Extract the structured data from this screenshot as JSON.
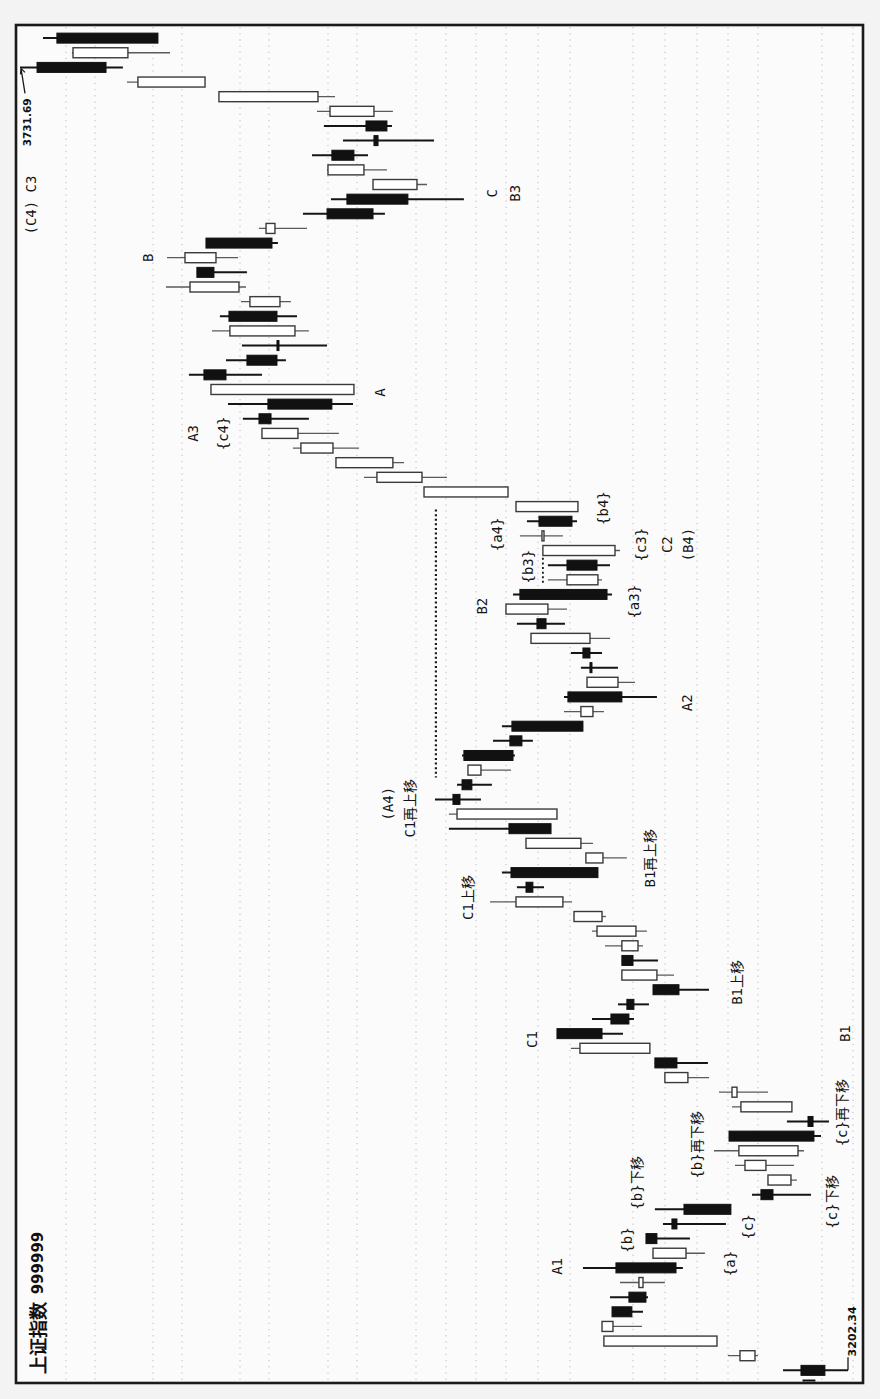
{
  "chart_data": {
    "type": "candlestick",
    "title": "上证指数 999999",
    "instrument": {
      "name": "上证指数",
      "code": "999999"
    },
    "orientation": "rotated 90° counter-clockwise: time runs bottom→top, price increases toward the left",
    "xlabel": "",
    "ylabel": "",
    "price_axis": {
      "max": 3731.69,
      "min": 3202.34
    },
    "grid": true,
    "legend": null,
    "colors": {
      "up_body": "#ffffff",
      "down_body": "#111111",
      "outline": "#333333",
      "frame": "#1a1a1a"
    },
    "markers": {
      "high": {
        "label": "3731.69",
        "index": 90,
        "price": 3731.69
      },
      "low": {
        "label": "3202.34",
        "index": 1,
        "price": 3202.34
      }
    },
    "candle_columns": [
      "open",
      "high",
      "low",
      "close"
    ],
    "candles": [
      [
        3231.1,
        3231.1,
        3223.5,
        3223.5
      ],
      [
        3232.4,
        3243.9,
        3202.34,
        3217.1
      ],
      [
        3261.8,
        3279.1,
        3259.9,
        3271.4
      ],
      [
        3286.1,
        3358.4,
        3286.1,
        3358.4
      ],
      [
        3352.6,
        3359.6,
        3334.1,
        3359.6
      ],
      [
        3353.2,
        3353.2,
        3333.4,
        3340.5
      ],
      [
        3342.4,
        3354.5,
        3330.2,
        3331.5
      ],
      [
        3333.4,
        3348.1,
        3319.4,
        3336.0
      ],
      [
        3350.7,
        3371.8,
        3307.9,
        3312.3
      ],
      [
        3305.9,
        3327.0,
        3293.8,
        3327.0
      ],
      [
        3331.5,
        3331.5,
        3303.4,
        3324.5
      ],
      [
        3314.9,
        3320.6,
        3280.4,
        3311.7
      ],
      [
        3307.2,
        3325.8,
        3277.2,
        3277.2
      ],
      [
        3258.0,
        3263.7,
        3226.0,
        3250.3
      ],
      [
        3238.8,
        3253.5,
        3235.0,
        3253.5
      ],
      [
        3254.8,
        3274.6,
        3236.9,
        3268.2
      ],
      [
        3234.3,
        3288.0,
        3230.5,
        3272.1
      ],
      [
        3278.4,
        3278.4,
        3219.6,
        3224.1
      ],
      [
        3227.9,
        3241.4,
        3214.5,
        3224.7
      ],
      [
        3238.2,
        3276.5,
        3238.2,
        3270.8
      ],
      [
        3273.3,
        3284.8,
        3253.5,
        3276.5
      ],
      [
        3304.7,
        3319.4,
        3291.2,
        3319.4
      ],
      [
        3325.8,
        3325.8,
        3291.9,
        3311.7
      ],
      [
        3329.0,
        3379.5,
        3329.0,
        3373.7
      ],
      [
        3388.4,
        3388.4,
        3346.2,
        3359.6
      ],
      [
        3353.9,
        3366.0,
        3339.2,
        3342.4
      ],
      [
        3343.7,
        3349.4,
        3329.6,
        3339.2
      ],
      [
        3327.0,
        3327.0,
        3291.2,
        3310.4
      ],
      [
        3324.5,
        3346.9,
        3313.6,
        3346.9
      ],
      [
        3346.9,
        3346.9,
        3323.8,
        3339.8
      ],
      [
        3336.6,
        3357.7,
        3333.4,
        3346.9
      ],
      [
        3337.9,
        3366.0,
        3330.9,
        3362.8
      ],
      [
        3359.6,
        3377.5,
        3357.1,
        3377.5
      ],
      [
        3384.6,
        3431.2,
        3378.8,
        3414.6
      ],
      [
        3408.2,
        3414.0,
        3396.7,
        3403.8
      ],
      [
        3417.8,
        3423.6,
        3362.2,
        3362.2
      ],
      [
        3359.0,
        3369.9,
        3343.7,
        3369.9
      ],
      [
        3373.1,
        3408.2,
        3365.4,
        3408.2
      ],
      [
        3419.1,
        3457.5,
        3392.2,
        3392.2
      ],
      [
        3388.4,
        3457.5,
        3388.4,
        3452.3
      ],
      [
        3454.9,
        3466.4,
        3437.0,
        3450.4
      ],
      [
        3449.1,
        3452.3,
        3430.0,
        3442.8
      ],
      [
        3437.0,
        3445.3,
        3417.8,
        3445.3
      ],
      [
        3447.9,
        3449.1,
        3415.3,
        3416.5
      ],
      [
        3418.5,
        3429.3,
        3403.8,
        3410.8
      ],
      [
        3417.2,
        3423.6,
        3371.8,
        3371.8
      ],
      [
        3365.4,
        3383.9,
        3358.4,
        3373.1
      ],
      [
        3381.4,
        3383.9,
        3324.5,
        3346.9
      ],
      [
        3349.4,
        3369.2,
        3338.5,
        3369.2
      ],
      [
        3367.3,
        3373.1,
        3349.4,
        3366.7
      ],
      [
        3371.8,
        3379.5,
        3359.6,
        3367.3
      ],
      [
        3367.3,
        3405.0,
        3354.5,
        3405.0
      ],
      [
        3401.2,
        3414.0,
        3383.3,
        3395.4
      ],
      [
        3394.2,
        3421.0,
        3382.0,
        3421.0
      ],
      [
        3412.1,
        3416.5,
        3353.2,
        3356.4
      ],
      [
        3362.2,
        3394.2,
        3359.6,
        3382.0
      ],
      [
        3382.0,
        3394.2,
        3354.5,
        3362.8
      ],
      [
        3351.3,
        3397.4,
        3348.1,
        3397.4
      ],
      [
        3396.7,
        3412.1,
        3384.6,
        3398.0
      ],
      [
        3399.9,
        3407.6,
        3375.6,
        3378.8
      ],
      [
        3375.0,
        3414.6,
        3375.0,
        3414.6
      ],
      [
        3419.7,
        3473.4,
        3419.7,
        3473.4
      ],
      [
        3474.7,
        3511.8,
        3458.7,
        3503.5
      ],
      [
        3493.3,
        3529.7,
        3486.2,
        3529.7
      ],
      [
        3531.6,
        3557.2,
        3515.0,
        3552.1
      ],
      [
        3554.0,
        3577.0,
        3527.8,
        3577.0
      ],
      [
        3578.9,
        3589.2,
        3547.0,
        3571.2
      ],
      [
        3573.2,
        3598.7,
        3518.8,
        3532.3
      ],
      [
        3518.2,
        3609.6,
        3518.2,
        3609.6
      ],
      [
        3614.1,
        3623.7,
        3577.0,
        3600.0
      ],
      [
        3586.6,
        3600.0,
        3561.7,
        3567.4
      ],
      [
        3567.4,
        3589.8,
        3535.4,
        3566.8
      ],
      [
        3555.9,
        3609.0,
        3547.0,
        3597.5
      ],
      [
        3598.1,
        3603.9,
        3554.6,
        3567.4
      ],
      [
        3565.5,
        3590.4,
        3558.5,
        3584.7
      ],
      [
        3591.7,
        3638.4,
        3587.2,
        3623.0
      ],
      [
        3618.6,
        3618.6,
        3586.6,
        3607.7
      ],
      [
        3606.4,
        3637.7,
        3592.3,
        3626.2
      ],
      [
        3612.8,
        3612.8,
        3566.8,
        3570.6
      ],
      [
        3568.7,
        3578.9,
        3548.2,
        3574.4
      ],
      [
        3535.4,
        3550.8,
        3498.4,
        3506.0
      ],
      [
        3522.7,
        3532.9,
        3447.9,
        3483.7
      ],
      [
        3477.9,
        3506.0,
        3471.5,
        3506.0
      ],
      [
        3511.8,
        3535.4,
        3497.1,
        3534.8
      ],
      [
        3532.3,
        3545.0,
        3509.2,
        3518.2
      ],
      [
        3505.4,
        3525.2,
        3467.0,
        3502.8
      ],
      [
        3510.5,
        3537.4,
        3493.9,
        3497.1
      ],
      [
        3505.4,
        3541.8,
        3493.3,
        3533.5
      ],
      [
        3541.2,
        3604.5,
        3530.3,
        3604.5
      ],
      [
        3613.4,
        3663.3,
        3613.4,
        3656.3
      ],
      [
        3720.8,
        3731.69,
        3665.9,
        3676.7
      ],
      [
        3662.7,
        3698.5,
        3635.8,
        3697.8
      ],
      [
        3708.1,
        3717.0,
        3643.5,
        3643.5
      ]
    ],
    "annotations": [
      {
        "text": "(C4) C3",
        "index": 80.6,
        "price": 3724.7
      },
      {
        "text": "B",
        "index": 77.0,
        "price": 3649.9
      },
      {
        "text": "A3",
        "index": 65.0,
        "price": 3621.1
      },
      {
        "text": "{c4}",
        "index": 65.0,
        "price": 3601.9
      },
      {
        "text": "A",
        "index": 67.8,
        "price": 3501.6
      },
      {
        "text": "C",
        "index": 81.4,
        "price": 3430.0
      },
      {
        "text": "B3",
        "index": 81.4,
        "price": 3415.3
      },
      {
        "text": "{a4}",
        "index": 58.1,
        "price": 3426.8
      },
      {
        "text": "{b4}",
        "index": 59.9,
        "price": 3359.0
      },
      {
        "text": "{b3}",
        "index": 55.9,
        "price": 3406.9
      },
      {
        "text": "{c3}",
        "index": 57.4,
        "price": 3334.7
      },
      {
        "text": "C2",
        "index": 57.4,
        "price": 3318.1
      },
      {
        "text": "(B4)",
        "index": 57.4,
        "price": 3304.7
      },
      {
        "text": "B2",
        "index": 53.2,
        "price": 3436.4
      },
      {
        "text": "{a3}",
        "index": 53.5,
        "price": 3339.2
      },
      {
        "text": "A2",
        "index": 46.6,
        "price": 3305.3
      },
      {
        "text": "(A4)",
        "index": 39.7,
        "price": 3496.5
      },
      {
        "text": "C1再上移",
        "index": 39.4,
        "price": 3482.4
      },
      {
        "text": "B1再上移",
        "index": 36.0,
        "price": 3329.0
      },
      {
        "text": "C1上移",
        "index": 33.3,
        "price": 3445.3
      },
      {
        "text": "B1上移",
        "index": 27.5,
        "price": 3273.3
      },
      {
        "text": "C1",
        "index": 23.6,
        "price": 3404.4
      },
      {
        "text": "B1",
        "index": 24.0,
        "price": 3204.3
      },
      {
        "text": "{c}再下移",
        "index": 18.6,
        "price": 3206.2
      },
      {
        "text": "{b}再下移",
        "index": 16.4,
        "price": 3298.9
      },
      {
        "text": "{b}下移",
        "index": 13.8,
        "price": 3337.3
      },
      {
        "text": "{c}下移",
        "index": 12.5,
        "price": 3212.6
      },
      {
        "text": "{b}",
        "index": 9.9,
        "price": 3343.7
      },
      {
        "text": "{c}",
        "index": 10.8,
        "price": 3266.3
      },
      {
        "text": "{a}",
        "index": 8.3,
        "price": 3277.8
      },
      {
        "text": "A1",
        "index": 8.1,
        "price": 3388.4
      }
    ],
    "level_lines": [
      {
        "price": 3465.8,
        "from_index": 41.5,
        "to_index": 59.8,
        "style": "dotted"
      },
      {
        "price": 3397.4,
        "from_index": 54.8,
        "to_index": 56.5,
        "style": "dotted-short"
      }
    ]
  }
}
